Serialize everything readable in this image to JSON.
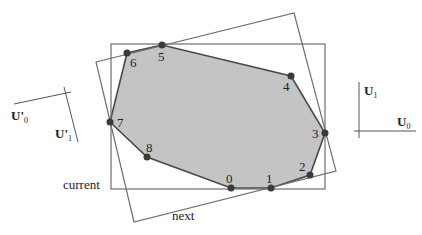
{
  "diagram": {
    "type": "rotating-calipers-bounding-rectangles",
    "colors": {
      "hull_fill": "#c4c4c4",
      "hull_stroke": "#4a4a4a",
      "rect_stroke": "#6e6e6e",
      "point_fill": "#3a3a3a",
      "text": "#222222"
    },
    "hull_points": [
      {
        "id": "0",
        "label": "0",
        "x": 231,
        "y": 188
      },
      {
        "id": "1",
        "label": "1",
        "x": 271,
        "y": 188
      },
      {
        "id": "2",
        "label": "2",
        "x": 310,
        "y": 175
      },
      {
        "id": "3",
        "label": "3",
        "x": 325,
        "y": 133
      },
      {
        "id": "4",
        "label": "4",
        "x": 291,
        "y": 76
      },
      {
        "id": "5",
        "label": "5",
        "x": 162,
        "y": 45
      },
      {
        "id": "6",
        "label": "6",
        "x": 127,
        "y": 53
      },
      {
        "id": "7",
        "label": "7",
        "x": 110,
        "y": 122
      },
      {
        "id": "8",
        "label": "8",
        "x": 147,
        "y": 157
      }
    ],
    "rectangles": {
      "current": {
        "label": "current",
        "x1": 111,
        "y1": 44,
        "x2": 325,
        "y2": 189
      },
      "next": {
        "label": "next",
        "corners": [
          [
            96,
            62
          ],
          [
            294,
            13
          ],
          [
            336,
            171
          ],
          [
            134,
            222
          ]
        ]
      }
    },
    "axes": {
      "current_frame": {
        "u0": "U",
        "u0_sub": "0",
        "u1": "U",
        "u1_sub": "1"
      },
      "next_frame": {
        "u0": "U'",
        "u0_sub": "0",
        "u1": "U'",
        "u1_sub": "1"
      }
    }
  }
}
